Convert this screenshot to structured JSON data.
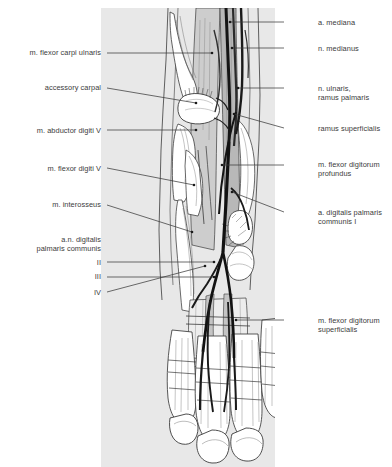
{
  "figure": {
    "panel_color": "#e8e8e8",
    "background_color": "#ffffff",
    "ink_color": "#3b3b3b",
    "vessel_color": "#1a1a1a",
    "muscle_fill": "#bfbfbf"
  },
  "labels": {
    "left": [
      {
        "id": "m-flexor-carpi-ulnaris",
        "text": "m. flexor carpi ulnaris",
        "x": 9,
        "y": 48,
        "width": 92,
        "leader": {
          "x1": 107,
          "y1": 53,
          "x2": 212,
          "y2": 53
        }
      },
      {
        "id": "accessory-carpal",
        "text": "accessory carpal",
        "x": 9,
        "y": 83,
        "width": 92,
        "leader": {
          "x1": 107,
          "y1": 88,
          "x2": 196,
          "y2": 103
        }
      },
      {
        "id": "m-abductor-digiti-v",
        "text": "m. abductor digiti V",
        "x": 9,
        "y": 126,
        "width": 92,
        "leader": {
          "x1": 107,
          "y1": 130,
          "x2": 196,
          "y2": 130
        }
      },
      {
        "id": "m-flexor-digiti-v",
        "text": "m. flexor digiti V",
        "x": 9,
        "y": 164,
        "width": 92,
        "leader": {
          "x1": 107,
          "y1": 168,
          "x2": 194,
          "y2": 185
        }
      },
      {
        "id": "m-interosseus",
        "text": "m. interosseus",
        "x": 9,
        "y": 200,
        "width": 92,
        "leader": {
          "x1": 107,
          "y1": 205,
          "x2": 192,
          "y2": 232
        }
      },
      {
        "id": "an-digitalis-palmaris-communis",
        "text": "a.n. digitalis\npalmaris communis",
        "x": 9,
        "y": 235,
        "width": 92,
        "leader": null
      },
      {
        "id": "digit-ii",
        "text": "II",
        "x": 9,
        "y": 258,
        "width": 92,
        "leader": {
          "x1": 107,
          "y1": 262,
          "x2": 214,
          "y2": 262
        }
      },
      {
        "id": "digit-iii",
        "text": "III",
        "x": 9,
        "y": 272,
        "width": 92,
        "leader": {
          "x1": 107,
          "y1": 277,
          "x2": 214,
          "y2": 277
        }
      },
      {
        "id": "digit-iv",
        "text": "IV",
        "x": 9,
        "y": 288,
        "width": 92,
        "leader": {
          "x1": 107,
          "y1": 292,
          "x2": 205,
          "y2": 266
        }
      }
    ],
    "right": [
      {
        "id": "a-mediana",
        "text": "a. mediana",
        "x": 318,
        "y": 18,
        "width": 70,
        "leader": {
          "x1": 284,
          "y1": 22,
          "x2": 230,
          "y2": 22
        }
      },
      {
        "id": "n-medianus",
        "text": "n. medianus",
        "x": 318,
        "y": 44,
        "width": 70,
        "leader": {
          "x1": 284,
          "y1": 48,
          "x2": 232,
          "y2": 48
        }
      },
      {
        "id": "n-ulnaris-ramus-palmaris",
        "text": "n. ulnaris,\nramus palmaris",
        "x": 318,
        "y": 84,
        "width": 70,
        "leader": {
          "x1": 284,
          "y1": 88,
          "x2": 238,
          "y2": 88
        }
      },
      {
        "id": "ramus-superficialis",
        "text": "ramus superficialis",
        "x": 318,
        "y": 124,
        "width": 74,
        "leader": {
          "x1": 284,
          "y1": 128,
          "x2": 234,
          "y2": 114
        }
      },
      {
        "id": "m-flexor-digitorum-profundus",
        "text": "m. flexor digitorum\nprofundus",
        "x": 318,
        "y": 160,
        "width": 74,
        "leader": {
          "x1": 284,
          "y1": 165,
          "x2": 222,
          "y2": 165
        }
      },
      {
        "id": "a-digitalis-palmaris-communis-i",
        "text": "a. digitalis palmaris\ncommunis I",
        "x": 318,
        "y": 208,
        "width": 74,
        "leader": {
          "x1": 284,
          "y1": 212,
          "x2": 232,
          "y2": 192
        }
      },
      {
        "id": "m-flexor-digitorum-superficialis",
        "text": "m. flexor digitorum\nsuperficialis",
        "x": 318,
        "y": 316,
        "width": 74,
        "leader": {
          "x1": 284,
          "y1": 320,
          "x2": 236,
          "y2": 320
        }
      }
    ]
  }
}
